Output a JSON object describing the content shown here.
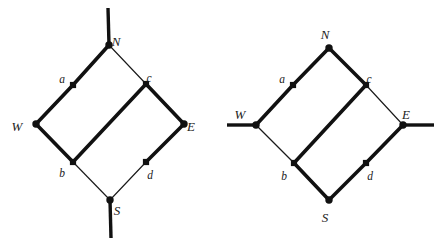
{
  "figure": {
    "name": "two-crossing-diagrams",
    "width": 446,
    "height": 249,
    "background_color": "#ffffff",
    "ink_color": "#111111",
    "diagrams": [
      {
        "id": "left-diagram",
        "name": "left-diamond-diagram",
        "stem_orientation": "vertical",
        "nodes": [
          {
            "id": "N",
            "label": "N",
            "x": 109,
            "y": 45,
            "size": "large",
            "label_dx": 7,
            "label_dy": -2
          },
          {
            "id": "a",
            "label": "a",
            "x": 73,
            "y": 85,
            "size": "small",
            "label_dx": -11,
            "label_dy": -5
          },
          {
            "id": "W",
            "label": "W",
            "x": 36,
            "y": 124,
            "size": "large",
            "label_dx": -19,
            "label_dy": 4
          },
          {
            "id": "b",
            "label": "b",
            "x": 73,
            "y": 162,
            "size": "small",
            "label_dx": -11,
            "label_dy": 12
          },
          {
            "id": "S",
            "label": "S",
            "x": 110,
            "y": 200,
            "size": "large",
            "label_dx": 7,
            "label_dy": 12
          },
          {
            "id": "d",
            "label": "d",
            "x": 146,
            "y": 162,
            "size": "small",
            "label_dx": 4,
            "label_dy": 14
          },
          {
            "id": "E",
            "label": "E",
            "x": 184,
            "y": 124,
            "size": "large",
            "label_dx": 7,
            "label_dy": 4
          },
          {
            "id": "c",
            "label": "c",
            "x": 146,
            "y": 84,
            "size": "small",
            "label_dx": 3,
            "label_dy": -5
          }
        ],
        "edges": [
          {
            "from": "N",
            "to": "a",
            "weight": "thick"
          },
          {
            "from": "a",
            "to": "W",
            "weight": "thick"
          },
          {
            "from": "W",
            "to": "b",
            "weight": "thick"
          },
          {
            "from": "b",
            "to": "c",
            "weight": "thick"
          },
          {
            "from": "c",
            "to": "E",
            "weight": "thick"
          },
          {
            "from": "E",
            "to": "d",
            "weight": "thick"
          },
          {
            "from": "N",
            "to": "c",
            "weight": "thin"
          },
          {
            "from": "b",
            "to": "S",
            "weight": "thin"
          },
          {
            "from": "d",
            "to": "S",
            "weight": "thin"
          }
        ],
        "stems": [
          {
            "id": "north-stem",
            "from_node": "N",
            "x1": 109,
            "y1": 45,
            "x2": 108,
            "y2": 8,
            "weight": "thick"
          },
          {
            "id": "south-stem",
            "from_node": "S",
            "x1": 110,
            "y1": 200,
            "x2": 111,
            "y2": 238,
            "weight": "thick"
          }
        ]
      },
      {
        "id": "right-diagram",
        "name": "right-diamond-diagram",
        "stem_orientation": "horizontal",
        "nodes": [
          {
            "id": "N",
            "label": "N",
            "x": 329,
            "y": 48,
            "size": "large",
            "label_dx": -4,
            "label_dy": -12
          },
          {
            "id": "a",
            "label": "a",
            "x": 293,
            "y": 85,
            "size": "small",
            "label_dx": -11,
            "label_dy": -5
          },
          {
            "id": "W",
            "label": "W",
            "x": 256,
            "y": 125,
            "size": "large",
            "label_dx": -16,
            "label_dy": -9
          },
          {
            "id": "b",
            "label": "b",
            "x": 294,
            "y": 163,
            "size": "small",
            "label_dx": -10,
            "label_dy": 14
          },
          {
            "id": "S",
            "label": "S",
            "x": 329,
            "y": 200,
            "size": "large",
            "label_dx": -4,
            "label_dy": 19
          },
          {
            "id": "d",
            "label": "d",
            "x": 366,
            "y": 163,
            "size": "small",
            "label_dx": 4,
            "label_dy": 14
          },
          {
            "id": "E",
            "label": "E",
            "x": 403,
            "y": 125,
            "size": "large",
            "label_dx": 3,
            "label_dy": -9
          },
          {
            "id": "c",
            "label": "c",
            "x": 366,
            "y": 85,
            "size": "small",
            "label_dx": 3,
            "label_dy": -5
          }
        ],
        "edges": [
          {
            "from": "W",
            "to": "a",
            "weight": "thick"
          },
          {
            "from": "a",
            "to": "N",
            "weight": "thick"
          },
          {
            "from": "N",
            "to": "c",
            "weight": "thick"
          },
          {
            "from": "c",
            "to": "b",
            "weight": "thick"
          },
          {
            "from": "b",
            "to": "S",
            "weight": "thick"
          },
          {
            "from": "S",
            "to": "d",
            "weight": "thick"
          },
          {
            "from": "d",
            "to": "E",
            "weight": "thick"
          },
          {
            "from": "W",
            "to": "b",
            "weight": "thin"
          },
          {
            "from": "c",
            "to": "E",
            "weight": "thin"
          }
        ],
        "stems": [
          {
            "id": "west-stem",
            "from_node": "W",
            "x1": 256,
            "y1": 125,
            "x2": 227,
            "y2": 125,
            "weight": "thick"
          },
          {
            "id": "east-stem",
            "from_node": "E",
            "x1": 403,
            "y1": 125,
            "x2": 434,
            "y2": 125,
            "weight": "thick"
          }
        ]
      }
    ]
  }
}
